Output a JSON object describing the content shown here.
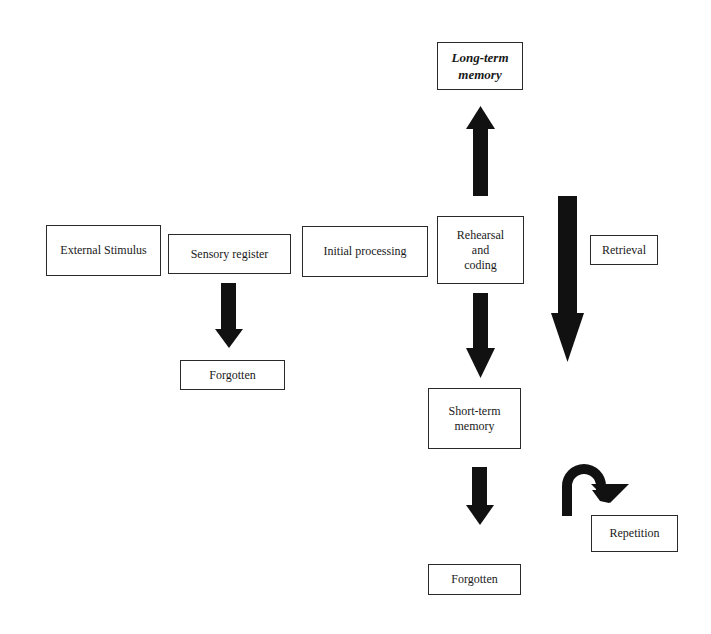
{
  "diagram": {
    "type": "flowchart",
    "title": "",
    "arrow_color": "#111111",
    "nodes": {
      "external_stimulus": {
        "label": "External Stimulus"
      },
      "sensory_register": {
        "label": "Sensory register"
      },
      "initial_processing": {
        "label": "Initial processing"
      },
      "rehearsal_coding": {
        "lines": [
          "Rehearsal",
          "and",
          "coding"
        ]
      },
      "long_term_memory": {
        "lines": [
          "Long-term",
          "memory"
        ]
      },
      "retrieval": {
        "label": "Retrieval"
      },
      "forgotten_sensory": {
        "label": "Forgotten"
      },
      "short_term_memory": {
        "lines": [
          "Short-term",
          "memory"
        ]
      },
      "forgotten_short_term": {
        "label": "Forgotten"
      },
      "repetition": {
        "label": "Repetition"
      }
    },
    "edges": [
      {
        "from": "Sensory register",
        "to": "Forgotten (sensory)",
        "direction": "down"
      },
      {
        "from": "Rehearsal and coding",
        "to": "Long-term memory",
        "direction": "up"
      },
      {
        "from": "Rehearsal and coding",
        "to": "Short-term memory",
        "direction": "down"
      },
      {
        "from": "Long-term memory",
        "to": "Short-term memory",
        "label": "Retrieval",
        "direction": "down"
      },
      {
        "from": "Short-term memory",
        "to": "Forgotten (short-term)",
        "direction": "down"
      },
      {
        "from": "Short-term memory",
        "to": "Short-term memory",
        "label": "Repetition",
        "direction": "u-turn"
      }
    ]
  }
}
